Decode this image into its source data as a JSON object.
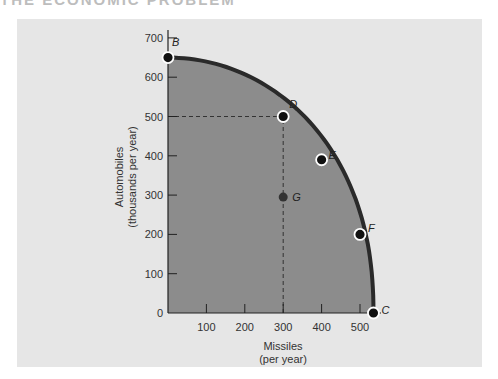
{
  "header": {
    "cut_title": "THE ECONOMIC PROBLEM"
  },
  "chart_data": {
    "type": "line",
    "subtype": "production-possibilities-frontier",
    "title": "",
    "xlabel": "Missiles",
    "xlabel_sub": "(per year)",
    "ylabel": "Automobiles",
    "ylabel_sub": "(thousands per year)",
    "xlim": [
      0,
      560
    ],
    "ylim": [
      0,
      700
    ],
    "x_ticks": [
      0,
      100,
      200,
      300,
      400,
      500
    ],
    "x_tick_labels": [
      "100",
      "200",
      "300",
      "400",
      "500"
    ],
    "y_ticks": [
      0,
      100,
      200,
      300,
      400,
      500,
      600,
      700
    ],
    "y_tick_labels": [
      "0",
      "100",
      "200",
      "300",
      "400",
      "500",
      "600",
      "700"
    ],
    "grid": false,
    "fill_under_curve": true,
    "colors": {
      "panel": "#e6e6e6",
      "fill": "#8c8c8c",
      "curve": "#2a2a2a",
      "point": "#111111"
    },
    "series": [
      {
        "name": "Frontier",
        "x": [
          0,
          300,
          400,
          500,
          535
        ],
        "y": [
          650,
          500,
          390,
          200,
          0
        ]
      }
    ],
    "points": [
      {
        "label": "B",
        "x": 0,
        "y": 650,
        "on_frontier": true
      },
      {
        "label": "D",
        "x": 300,
        "y": 500,
        "on_frontier": true
      },
      {
        "label": "E",
        "x": 400,
        "y": 390,
        "on_frontier": true
      },
      {
        "label": "F",
        "x": 500,
        "y": 200,
        "on_frontier": true
      },
      {
        "label": "C",
        "x": 535,
        "y": 0,
        "on_frontier": true
      },
      {
        "label": "G",
        "x": 300,
        "y": 295,
        "on_frontier": false
      }
    ],
    "reference_lines": [
      {
        "type": "horizontal-dashed",
        "y": 500,
        "from_x": 0,
        "to_x": 300
      },
      {
        "type": "vertical-dashed",
        "x": 300,
        "from_y": 0,
        "to_y": 500
      }
    ]
  }
}
